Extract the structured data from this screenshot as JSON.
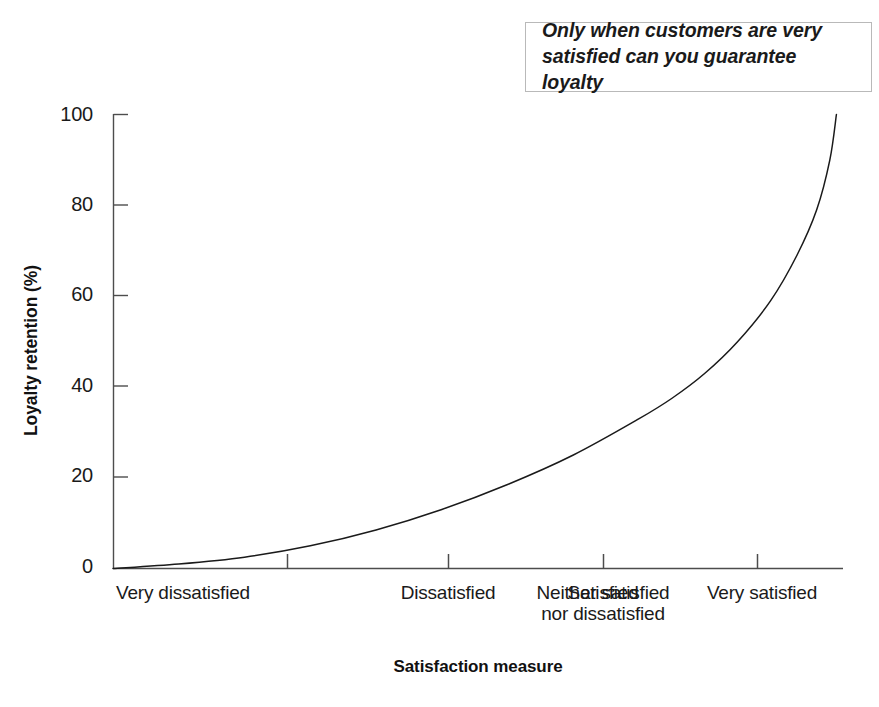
{
  "annotation": {
    "text": "Only when customers are very\nsatisfied can you guarantee loyalty"
  },
  "chart_data": {
    "type": "line",
    "title": "",
    "subtitle": "",
    "xlabel": "Satisfaction measure",
    "ylabel": "Loyalty retention (%)",
    "xlim": [
      0,
      5.55
    ],
    "ylim": [
      0,
      100
    ],
    "grid": false,
    "legend": null,
    "xtick_labels": [
      "Very dissatisfied",
      "Dissatisfied",
      "Neither satisfied\nnor dissatisfied",
      "Satisfied",
      "Very satisfied"
    ],
    "xticks": [
      1,
      2,
      3,
      4,
      5
    ],
    "ytick_labels": [
      "0",
      "20",
      "40",
      "60",
      "80",
      "100"
    ],
    "yticks": [
      0,
      20,
      40,
      60,
      80,
      100
    ],
    "series": [
      {
        "name": "Loyalty retention",
        "color": "#1a1a1a",
        "x": [
          0.0,
          0.5,
          1.0,
          1.5,
          2.0,
          2.5,
          3.0,
          3.5,
          4.0,
          4.25,
          4.5,
          4.75,
          5.0,
          5.2,
          5.35,
          5.45,
          5.5
        ],
        "y": [
          0.0,
          1.0,
          2.5,
          5.0,
          8.5,
          13.0,
          18.5,
          25.0,
          33.0,
          37.5,
          43.0,
          50.0,
          59.0,
          69.0,
          79.0,
          90.0,
          100.0
        ]
      }
    ],
    "annotations": [
      {
        "text": "Only when customers are very satisfied can you guarantee loyalty",
        "position": "top-right",
        "style": "boxed-bold-italic"
      }
    ]
  },
  "axes": {
    "y_tick_values": [
      "100",
      "80",
      "60",
      "40",
      "20",
      "0"
    ],
    "x_tick_values": [
      "Very dissatisfied",
      "Dissatisfied",
      "Neither satisfied\nnor dissatisfied",
      "Satisfied",
      "Very satisfied"
    ]
  }
}
